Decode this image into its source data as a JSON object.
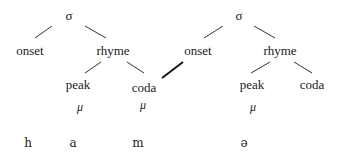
{
  "diagram": {
    "type": "syllable-structure-tree",
    "syllables": [
      {
        "root": "σ",
        "onset": "onset",
        "rhyme": "rhyme",
        "peak": "peak",
        "coda": "coda",
        "peak_mora": "μ",
        "coda_mora": "μ"
      },
      {
        "root": "σ",
        "onset": "onset",
        "rhyme": "rhyme",
        "peak": "peak",
        "coda": "coda",
        "peak_mora": "μ"
      }
    ],
    "segments": [
      "h",
      "a",
      "m",
      "ə"
    ],
    "ambisyllabic_link": "coda of syllable 1 linked to onset of syllable 2 (bold line)"
  }
}
